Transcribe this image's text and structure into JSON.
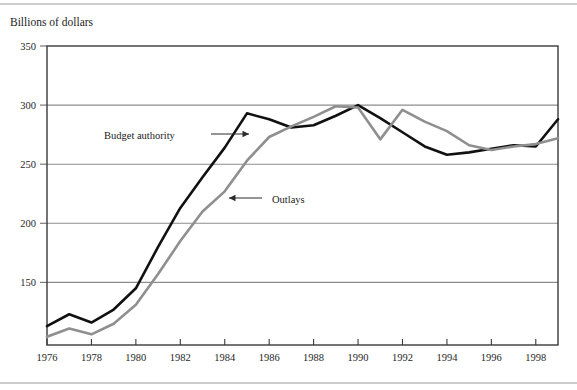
{
  "chart_data": {
    "type": "line",
    "title": "",
    "ylabel": "Billions of dollars",
    "xlabel": "",
    "ylim": [
      97,
      350
    ],
    "xlim": [
      1976,
      1999
    ],
    "grid": true,
    "grid_axis": "y",
    "legend_position": "inline-annotations",
    "yticks": [
      150,
      200,
      250,
      300,
      350
    ],
    "ytick_labels": [
      "150",
      "200",
      "250",
      "300",
      "350"
    ],
    "xticks": [
      1976,
      1978,
      1980,
      1982,
      1984,
      1986,
      1988,
      1990,
      1992,
      1994,
      1996,
      1998
    ],
    "xtick_labels": [
      "1976",
      "1978",
      "1980",
      "1982",
      "1984",
      "1986",
      "1988",
      "1990",
      "1992",
      "1994",
      "1996",
      "1998"
    ],
    "x": [
      1976,
      1977,
      1978,
      1979,
      1980,
      1981,
      1982,
      1983,
      1984,
      1985,
      1986,
      1987,
      1988,
      1989,
      1990,
      1991,
      1992,
      1993,
      1994,
      1995,
      1996,
      1997,
      1998,
      1999
    ],
    "series": [
      {
        "name": "Budget authority",
        "color": "#111111",
        "width": 2.6,
        "values": [
          113,
          123,
          116,
          127,
          145,
          180,
          213,
          239,
          264,
          293,
          288,
          281,
          283,
          291,
          300,
          289,
          277,
          265,
          258,
          260,
          263,
          266,
          265,
          288
        ]
      },
      {
        "name": "Outlays",
        "color": "#8f8f8f",
        "width": 2.6,
        "values": [
          104,
          111,
          106,
          115,
          131,
          157,
          185,
          210,
          227,
          253,
          273,
          282,
          290,
          299,
          298,
          271,
          296,
          286,
          278,
          266,
          262,
          265,
          267,
          272
        ]
      }
    ],
    "annotations": [
      {
        "name": "budget-authority",
        "label": "Budget authority",
        "text_x": 104,
        "text_y": 139,
        "arrow_from_x": 211,
        "arrow_from_y": 134,
        "arrow_to_x": 249,
        "arrow_to_y": 134,
        "direction": "right"
      },
      {
        "name": "outlays",
        "label": "Outlays",
        "text_x": 272,
        "text_y": 203,
        "arrow_from_x": 262,
        "arrow_from_y": 198,
        "arrow_to_x": 229,
        "arrow_to_y": 198,
        "direction": "left"
      }
    ]
  },
  "plot_geometry": {
    "left": 47,
    "right": 558,
    "top": 46,
    "bottom": 345
  }
}
